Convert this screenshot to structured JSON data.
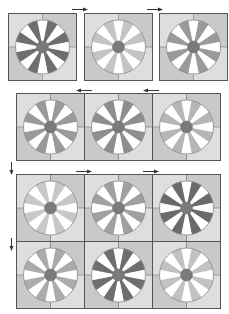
{
  "figure": {
    "colors": {
      "quad_light": "#dedede",
      "quad_dark": "#c9c9c9",
      "tile_border": "#555555",
      "hub": "#7a7a7a",
      "wheel_outline": "#8a8a8a",
      "wedge_white": "#ffffff",
      "shade_dark": "#6e6e6e",
      "shade_medium": "#9a9a9a",
      "shade_medlight": "#ababab",
      "shade_light": "#c4c4c4",
      "arrow": "#333333"
    },
    "top_row": [
      {
        "id": "t1",
        "shade": "#6e6e6e"
      },
      {
        "id": "t2",
        "shade": "#c4c4c4"
      },
      {
        "id": "t3",
        "shade": "#9a9a9a"
      }
    ],
    "middle_row": [
      {
        "id": "m1",
        "shade": "#9a9a9a"
      },
      {
        "id": "m2",
        "shade": "#8e8e8e"
      },
      {
        "id": "m3",
        "shade": "#b6b6b6"
      }
    ],
    "bottom_row_1": [
      {
        "id": "b1",
        "shade": "#c8c8c8"
      },
      {
        "id": "b2",
        "shade": "#a0a0a0"
      },
      {
        "id": "b3",
        "shade": "#6a6a6a"
      }
    ],
    "bottom_row_2": [
      {
        "id": "b4",
        "shade": "#ababab"
      },
      {
        "id": "b5",
        "shade": "#6e6e6e"
      },
      {
        "id": "b6",
        "shade": "#c2c2c2"
      }
    ],
    "arrows": [
      {
        "id": "a-top-1",
        "direction": "right",
        "x": 72,
        "y": 7
      },
      {
        "id": "a-top-2",
        "direction": "right",
        "x": 147,
        "y": 7
      },
      {
        "id": "a-mid-1",
        "direction": "left",
        "x": 76,
        "y": 88
      },
      {
        "id": "a-mid-2",
        "direction": "left",
        "x": 143,
        "y": 88
      },
      {
        "id": "a-down-1",
        "direction": "down",
        "x": 9,
        "y": 162
      },
      {
        "id": "a-bot-1",
        "direction": "right",
        "x": 76,
        "y": 169
      },
      {
        "id": "a-bot-2",
        "direction": "right",
        "x": 143,
        "y": 169
      },
      {
        "id": "a-down-2",
        "direction": "down",
        "x": 9,
        "y": 238
      }
    ]
  }
}
